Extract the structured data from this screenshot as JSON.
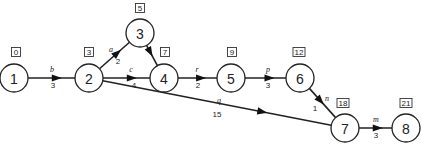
{
  "diagram": {
    "type": "activity-on-arrow network",
    "nodes": [
      {
        "id": "1",
        "label": "1",
        "x": 14,
        "y": 78,
        "time": "0",
        "box_x": 16,
        "box_y": 52
      },
      {
        "id": "2",
        "label": "2",
        "x": 89,
        "y": 78,
        "time": "3",
        "box_x": 89,
        "box_y": 52
      },
      {
        "id": "3",
        "label": "3",
        "x": 140,
        "y": 33,
        "time": "5",
        "box_x": 140,
        "box_y": 8
      },
      {
        "id": "4",
        "label": "4",
        "x": 164,
        "y": 78,
        "time": "7",
        "box_x": 165,
        "box_y": 52
      },
      {
        "id": "5",
        "label": "5",
        "x": 231,
        "y": 78,
        "time": "9",
        "box_x": 232,
        "box_y": 52
      },
      {
        "id": "6",
        "label": "6",
        "x": 300,
        "y": 78,
        "time": "12",
        "box_x": 299,
        "box_y": 52
      },
      {
        "id": "7",
        "label": "7",
        "x": 345,
        "y": 128,
        "time": "18",
        "box_x": 343,
        "box_y": 103
      },
      {
        "id": "8",
        "label": "8",
        "x": 406,
        "y": 128,
        "time": "21",
        "box_x": 406,
        "box_y": 103
      }
    ],
    "edges": [
      {
        "from": "1",
        "to": "2",
        "name": "b",
        "duration": "3",
        "name_x": 52,
        "name_y": 72,
        "dur_x": 53,
        "dur_y": 88
      },
      {
        "from": "2",
        "to": "3",
        "name": "a",
        "duration": "2",
        "name_x": 111,
        "name_y": 52,
        "dur_x": 118,
        "dur_y": 64
      },
      {
        "from": "2",
        "to": "4",
        "name": "c",
        "duration": "4",
        "name_x": 131,
        "name_y": 72,
        "dur_x": 134,
        "dur_y": 88
      },
      {
        "from": "3",
        "to": "4",
        "name": "",
        "duration": "",
        "name_x": 0,
        "name_y": 0,
        "dur_x": 0,
        "dur_y": 0
      },
      {
        "from": "4",
        "to": "5",
        "name": "r",
        "duration": "2",
        "name_x": 197,
        "name_y": 72,
        "dur_x": 198,
        "dur_y": 88
      },
      {
        "from": "5",
        "to": "6",
        "name": "p",
        "duration": "3",
        "name_x": 268,
        "name_y": 72,
        "dur_x": 268,
        "dur_y": 88
      },
      {
        "from": "2",
        "to": "7",
        "name": "q",
        "duration": "15",
        "name_x": 219,
        "name_y": 103,
        "dur_x": 217,
        "dur_y": 117
      },
      {
        "from": "6",
        "to": "7",
        "name": "n",
        "duration": "1",
        "name_x": 327,
        "name_y": 101,
        "dur_x": 315,
        "dur_y": 111
      },
      {
        "from": "7",
        "to": "8",
        "name": "m",
        "duration": "3",
        "name_x": 376,
        "name_y": 122,
        "dur_x": 376,
        "dur_y": 138
      }
    ]
  }
}
